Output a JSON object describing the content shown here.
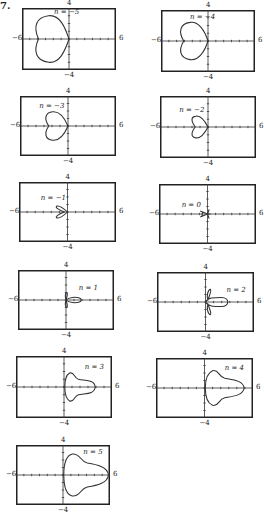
{
  "problem_mark": "7.",
  "chart_data": [
    {
      "type": "line",
      "title": "n = −5",
      "n": -5,
      "xlim": [
        -6,
        6
      ],
      "ylim": [
        -4,
        4
      ],
      "xticks_label": [
        "−6",
        "6"
      ],
      "yticks_label": [
        "4",
        "−4"
      ],
      "box": [
        22,
        8,
        94,
        62
      ],
      "label_pos": [
        -1.9,
        3.3
      ],
      "path": "M0,0 C-0.5,1.5 -1.2,3.2 -2.6,3.0 C-4.2,2.8 -4.6,1.6 -3.9,0 C-4.6,-1.6 -4.2,-2.8 -2.6,-3.0 C-1.2,-3.2 -0.5,-1.5 0,0 Z"
    },
    {
      "type": "line",
      "title": "n = −4",
      "n": -4,
      "xlim": [
        -6,
        6
      ],
      "ylim": [
        -4,
        4
      ],
      "xticks_label": [
        "−6",
        "6"
      ],
      "yticks_label": [
        "4",
        "−4"
      ],
      "box": [
        161,
        10,
        94,
        62
      ],
      "label_pos": [
        -2.3,
        3.0
      ],
      "path": "M0,0 C-0.4,1.3 -1.2,2.6 -2.3,2.4 C-3.6,2.2 -3.8,1.2 -3.1,0 C-3.8,-1.2 -3.6,-2.2 -2.3,-2.4 C-1.2,-2.6 -0.4,-1.3 0,0 Z"
    },
    {
      "type": "line",
      "title": "n = −3",
      "n": -3,
      "xlim": [
        -6,
        6
      ],
      "ylim": [
        -4,
        4
      ],
      "xticks_label": [
        "−6",
        "6"
      ],
      "yticks_label": [
        "4",
        "−4"
      ],
      "box": [
        20,
        96,
        96,
        60
      ],
      "label_pos": [
        -3.6,
        2.6
      ],
      "path": "M0,0 C-0.4,1.0 -1.0,2.0 -1.9,1.9 C-2.9,1.8 -3.0,0.9 -2.4,0 C-3.0,-0.9 -2.9,-1.8 -1.9,-1.9 C-1.0,-2.0 -0.4,-1.0 0,0 Z"
    },
    {
      "type": "line",
      "title": "n = −2",
      "n": -2,
      "xlim": [
        -6,
        6
      ],
      "ylim": [
        -4,
        4
      ],
      "xticks_label": [
        "−6",
        "6"
      ],
      "yticks_label": [
        "4",
        "−4"
      ],
      "box": [
        160,
        96,
        96,
        62
      ],
      "label_pos": [
        -3.6,
        2.1
      ],
      "path": "M0,0 C-0.4,0.8 -0.9,1.5 -1.5,1.4 C-2.2,1.3 -2.1,0.7 -1.6,0 C-2.1,-0.7 -2.2,-1.3 -1.5,-1.4 C-0.9,-1.5 -0.4,-0.8 0,0 Z"
    },
    {
      "type": "line",
      "title": "n = −1",
      "n": -1,
      "xlim": [
        -6,
        6
      ],
      "ylim": [
        -4,
        4
      ],
      "xticks_label": [
        "−6",
        "6"
      ],
      "yticks_label": [
        "4",
        "−4"
      ],
      "box": [
        19,
        182,
        97,
        60
      ],
      "label_pos": [
        -3.3,
        1.8
      ],
      "path": "M0,0 C-0.4,0.4 -1.0,0.9 -1.3,0.8 C-1.6,0.6 -1.1,0.3 -0.4,0 C-1.1,-0.3 -1.6,-0.6 -1.3,-0.8 C-1.0,-0.9 -0.4,-0.4 0,0 Z"
    },
    {
      "type": "line",
      "title": "n = 0",
      "n": 0,
      "xlim": [
        -6,
        6
      ],
      "ylim": [
        -4,
        4
      ],
      "xticks_label": [
        "−6",
        "6"
      ],
      "yticks_label": [
        "4",
        "−4"
      ],
      "box": [
        159,
        184,
        97,
        60
      ],
      "label_pos": [
        -3.2,
        1.1
      ],
      "path": "M0,0 L-0.9,0.4 M0,0 L-0.9,-0.4 M0,0 L0.2,0.6 M0,0 L0.2,-0.6 M-0.6,0.25 L-0.7,-0.25 M0,0 L0.4,0"
    },
    {
      "type": "line",
      "title": "n = 1",
      "n": 1,
      "xlim": [
        -6,
        6
      ],
      "ylim": [
        -4,
        4
      ],
      "xticks_label": [
        "−6",
        "6"
      ],
      "yticks_label": [
        "4",
        "−4"
      ],
      "box": [
        18,
        270,
        96,
        60
      ],
      "label_pos": [
        1.6,
        1.5
      ],
      "path": "M0,0 C0.4,0.4 1.2,0.4 1.6,0.3 C2.0,0.2 2.0,-0.2 1.6,-0.3 C1.2,-0.4 0.4,-0.4 0,0 Z M0,0 C0.1,0.4 0.3,0.9 0.1,1.0 C-0.1,0.9 -0.1,0.4 0,0 Z M0,0 C0.1,-0.4 0.3,-0.9 0.1,-1.0 C-0.1,-0.9 -0.1,-0.4 0,0 Z"
    },
    {
      "type": "line",
      "title": "n = 2",
      "n": 2,
      "xlim": [
        -6,
        6
      ],
      "ylim": [
        -4,
        4
      ],
      "xticks_label": [
        "−6",
        "6"
      ],
      "yticks_label": [
        "4",
        "−4"
      ],
      "box": [
        157,
        272,
        97,
        60
      ],
      "label_pos": [
        2.6,
        1.5
      ],
      "path": "M0,0 C0.3,0.6 1.0,0.6 2.0,0.6 C3.0,0.6 3.0,-0.6 2.0,-0.6 C1.0,-0.6 0.3,-0.6 0,0 Z M0.3,0.3 C0.5,0.9 0.8,1.6 0.6,1.7 C0.3,1.6 0.1,0.8 0.3,0.3 Z M0.3,-0.3 C0.5,-0.9 0.8,-1.6 0.6,-1.7 C0.3,-1.6 0.1,-0.8 0.3,-0.3 Z"
    },
    {
      "type": "line",
      "title": "n = 3",
      "n": 3,
      "xlim": [
        -6,
        6
      ],
      "ylim": [
        -4,
        4
      ],
      "xticks_label": [
        "−6",
        "6"
      ],
      "yticks_label": [
        "4",
        "−4"
      ],
      "box": [
        16,
        356,
        96,
        62
      ],
      "label_pos": [
        2.6,
        2.4
      ],
      "path": "M0.1,0 C0.1,0.8 0.2,1.5 0.7,1.8 C1.3,2.0 1.2,1.2 1.8,1.0 C2.6,0.8 3.8,1.0 3.9,0 C3.8,-1.0 2.6,-0.8 1.8,-1.0 C1.2,-1.2 1.3,-2.0 0.7,-1.8 C0.2,-1.5 0.1,-0.8 0.1,0 Z"
    },
    {
      "type": "line",
      "title": "n = 4",
      "n": 4,
      "xlim": [
        -6,
        6
      ],
      "ylim": [
        -4,
        4
      ],
      "xticks_label": [
        "−6",
        "6"
      ],
      "yticks_label": [
        "4",
        "−4"
      ],
      "box": [
        156,
        358,
        97,
        60
      ],
      "label_pos": [
        2.5,
        2.6
      ],
      "path": "M0.1,0 C0.1,1.2 0.3,2.0 1.0,2.3 C1.8,2.5 1.7,1.5 2.5,1.3 C3.5,1.1 4.8,1.0 4.9,0 C4.8,-1.0 3.5,-1.1 2.5,-1.3 C1.7,-1.5 1.8,-2.5 1.0,-2.3 C0.3,-2.0 0.1,-1.2 0.1,0 Z"
    },
    {
      "type": "line",
      "title": "n = 5",
      "n": 5,
      "xlim": [
        -6,
        6
      ],
      "ylim": [
        -4,
        4
      ],
      "xticks_label": [
        "−6",
        "6"
      ],
      "yticks_label": [
        "4",
        "−4"
      ],
      "box": [
        16,
        445,
        94,
        60
      ],
      "label_pos": [
        2.6,
        3.0
      ],
      "path": "M0.1,0 C0.1,1.4 0.3,2.6 1.2,2.8 C2.2,2.9 2.2,1.8 3.1,1.6 C4.3,1.4 5.7,1.1 5.8,0 C5.7,-1.1 4.3,-1.4 3.1,-1.6 C2.2,-1.8 2.2,-2.9 1.2,-2.8 C0.3,-2.6 0.1,-1.4 0.1,0 Z"
    }
  ]
}
